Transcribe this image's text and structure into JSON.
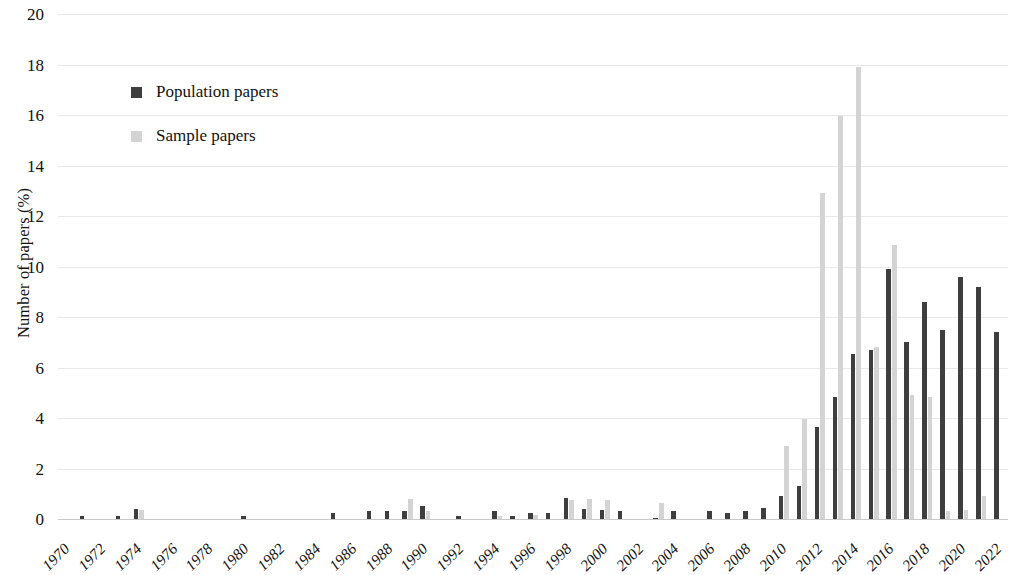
{
  "chart_data": {
    "type": "bar",
    "title": "",
    "xlabel": "",
    "ylabel": "Number of papers (%)",
    "ylim": [
      0,
      20
    ],
    "ytick_step": 2,
    "yticks": [
      0,
      2,
      4,
      6,
      8,
      10,
      12,
      14,
      16,
      18,
      20
    ],
    "grid": true,
    "legend_position": "upper-left",
    "xtick_labels": [
      "1970",
      "1972",
      "1974",
      "1976",
      "1978",
      "1980",
      "1982",
      "1984",
      "1986",
      "1988",
      "1990",
      "1992",
      "1994",
      "1996",
      "1998",
      "2000",
      "2002",
      "2004",
      "2006",
      "2008",
      "2010",
      "2012",
      "2014",
      "2016",
      "2018",
      "2020",
      "2022"
    ],
    "categories": [
      "1970",
      "1971",
      "1972",
      "1973",
      "1974",
      "1975",
      "1976",
      "1977",
      "1978",
      "1979",
      "1980",
      "1981",
      "1982",
      "1983",
      "1984",
      "1985",
      "1986",
      "1987",
      "1988",
      "1989",
      "1990",
      "1991",
      "1992",
      "1993",
      "1994",
      "1995",
      "1996",
      "1997",
      "1998",
      "1999",
      "2000",
      "2001",
      "2002",
      "2003",
      "2004",
      "2005",
      "2006",
      "2007",
      "2008",
      "2009",
      "2010",
      "2011",
      "2012",
      "2013",
      "2014",
      "2015",
      "2016",
      "2017",
      "2018",
      "2019",
      "2020",
      "2021",
      "2022"
    ],
    "series": [
      {
        "name": "Population papers",
        "color": "#3e3e3e",
        "values": [
          0,
          0.1,
          0,
          0.1,
          0.4,
          0,
          0,
          0,
          0,
          0,
          0.1,
          0,
          0,
          0,
          0,
          0.25,
          0,
          0.3,
          0.3,
          0.3,
          0.5,
          0,
          0.1,
          0,
          0.3,
          0.1,
          0.25,
          0.25,
          0.85,
          0.4,
          0.35,
          0.3,
          0,
          0.05,
          0.3,
          0,
          0.3,
          0.25,
          0.3,
          0.45,
          0.9,
          1.3,
          3.65,
          4.85,
          6.55,
          6.7,
          9.9,
          7.0,
          8.6,
          7.5,
          9.6,
          9.2,
          7.4
        ]
      },
      {
        "name": "Sample papers",
        "color": "#d4d4d4",
        "values": [
          0,
          0,
          0,
          0,
          0.35,
          0,
          0,
          0,
          0,
          0,
          0,
          0,
          0,
          0,
          0,
          0,
          0,
          0,
          0,
          0.8,
          0.3,
          0,
          0,
          0,
          0.1,
          0,
          0.15,
          0,
          0.75,
          0.8,
          0.75,
          0,
          0,
          0.65,
          0,
          0,
          0,
          0,
          0,
          0,
          2.9,
          3.95,
          12.9,
          15.95,
          17.9,
          6.8,
          10.85,
          4.9,
          4.85,
          0.3,
          0.35,
          0.9,
          0
        ]
      }
    ]
  },
  "legend": {
    "items": [
      {
        "label": "Population papers",
        "swatch": "population"
      },
      {
        "label": "Sample papers",
        "swatch": "sample"
      }
    ]
  },
  "axes": {
    "y_title": "Number of papers (%)"
  }
}
